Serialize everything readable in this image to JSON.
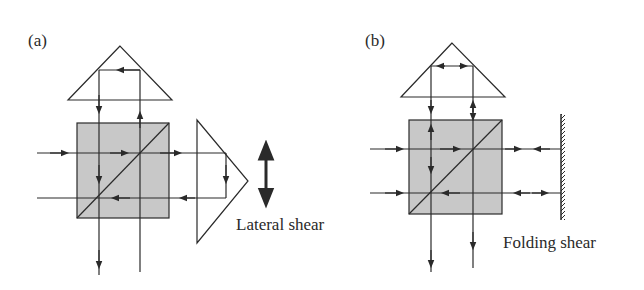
{
  "figure": {
    "panels": [
      {
        "id": "a",
        "label": "(a)",
        "caption": "Lateral shear",
        "components": [
          "right-angle-prism-top",
          "beam-splitter-cube",
          "right-angle-prism-side",
          "shear-direction-arrow"
        ]
      },
      {
        "id": "b",
        "label": "(b)",
        "caption": "Folding shear",
        "components": [
          "right-angle-prism-top",
          "beam-splitter-cube",
          "plane-mirror"
        ]
      }
    ]
  },
  "colors": {
    "line": "#2a2a2a",
    "cube_fill": "#c8c8c8",
    "background": "#ffffff"
  }
}
